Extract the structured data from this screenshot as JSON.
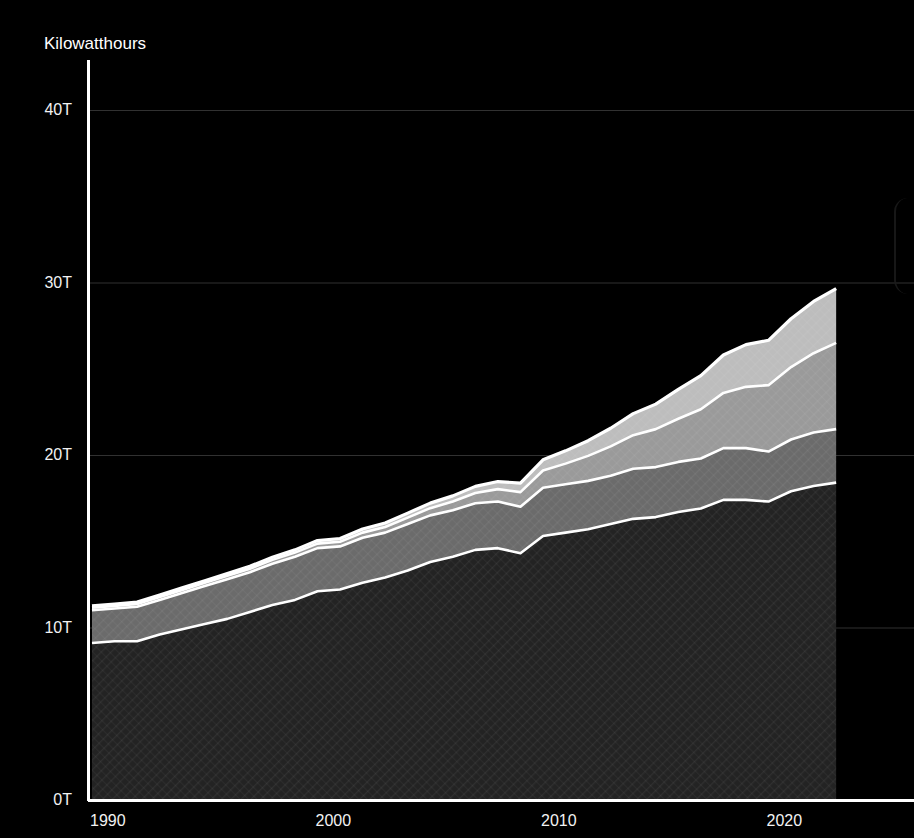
{
  "headline": {
    "text": "",
    "note": "clipped-at-top"
  },
  "axes": {
    "y_title": "Kilowatthours",
    "y_ticks": [
      "0T",
      "10T",
      "20T",
      "30T",
      "40T"
    ],
    "x_ticks": [
      "1990",
      "2000",
      "2010",
      "2020"
    ]
  },
  "colors": {
    "background": "#000000",
    "axis": "#ffffff",
    "gridline": "#5a5a5a",
    "series_1": "#232323",
    "series_2": "#6b6b6b",
    "series_3": "#9a9a9a",
    "series_4": "#bdbdbd",
    "series_5": "#d8d8d8",
    "boundary": "#ffffff",
    "text": "#f2f2f2"
  },
  "chart_data": {
    "type": "area",
    "stacked": true,
    "title": "",
    "xlabel": "",
    "ylabel": "Kilowatthours",
    "ylim": [
      0,
      40
    ],
    "xlim": [
      1990,
      2023
    ],
    "y_unit": "T",
    "y_tick_values": [
      0,
      10,
      20,
      30,
      40
    ],
    "x_tick_values": [
      1990,
      2000,
      2010,
      2020
    ],
    "grid": true,
    "legend": "none",
    "x": [
      1990,
      1991,
      1992,
      1993,
      1994,
      1995,
      1996,
      1997,
      1998,
      1999,
      2000,
      2001,
      2002,
      2003,
      2004,
      2005,
      2006,
      2007,
      2008,
      2009,
      2010,
      2011,
      2012,
      2013,
      2014,
      2015,
      2016,
      2017,
      2018,
      2019,
      2020,
      2021,
      2022,
      2023
    ],
    "series": [
      {
        "name": "series-1",
        "values": [
          9.1,
          9.2,
          9.2,
          9.6,
          9.9,
          10.2,
          10.5,
          10.9,
          11.3,
          11.6,
          12.1,
          12.2,
          12.6,
          12.9,
          13.3,
          13.8,
          14.1,
          14.5,
          14.6,
          14.3,
          15.3,
          15.5,
          15.7,
          16.0,
          16.3,
          16.4,
          16.7,
          16.9,
          17.4,
          17.4,
          17.3,
          17.9,
          18.2,
          18.4
        ]
      },
      {
        "name": "series-2",
        "values": [
          1.9,
          1.9,
          2.0,
          2.0,
          2.1,
          2.2,
          2.3,
          2.3,
          2.4,
          2.5,
          2.5,
          2.5,
          2.6,
          2.6,
          2.7,
          2.7,
          2.7,
          2.7,
          2.7,
          2.7,
          2.8,
          2.8,
          2.8,
          2.8,
          2.9,
          2.9,
          2.9,
          2.9,
          3.0,
          3.0,
          2.9,
          3.0,
          3.1,
          3.1
        ]
      },
      {
        "name": "series-3",
        "values": [
          0.15,
          0.15,
          0.16,
          0.17,
          0.18,
          0.19,
          0.2,
          0.21,
          0.22,
          0.24,
          0.26,
          0.27,
          0.3,
          0.33,
          0.37,
          0.42,
          0.5,
          0.6,
          0.72,
          0.85,
          1.0,
          1.2,
          1.45,
          1.7,
          1.95,
          2.2,
          2.5,
          2.85,
          3.2,
          3.55,
          3.85,
          4.2,
          4.6,
          5.0
        ]
      },
      {
        "name": "series-4",
        "values": [
          0.1,
          0.1,
          0.11,
          0.11,
          0.12,
          0.12,
          0.13,
          0.14,
          0.15,
          0.16,
          0.18,
          0.19,
          0.21,
          0.23,
          0.26,
          0.29,
          0.33,
          0.38,
          0.44,
          0.52,
          0.62,
          0.74,
          0.88,
          1.05,
          1.25,
          1.45,
          1.7,
          1.95,
          2.2,
          2.45,
          2.6,
          2.8,
          3.0,
          3.15
        ]
      }
    ]
  }
}
